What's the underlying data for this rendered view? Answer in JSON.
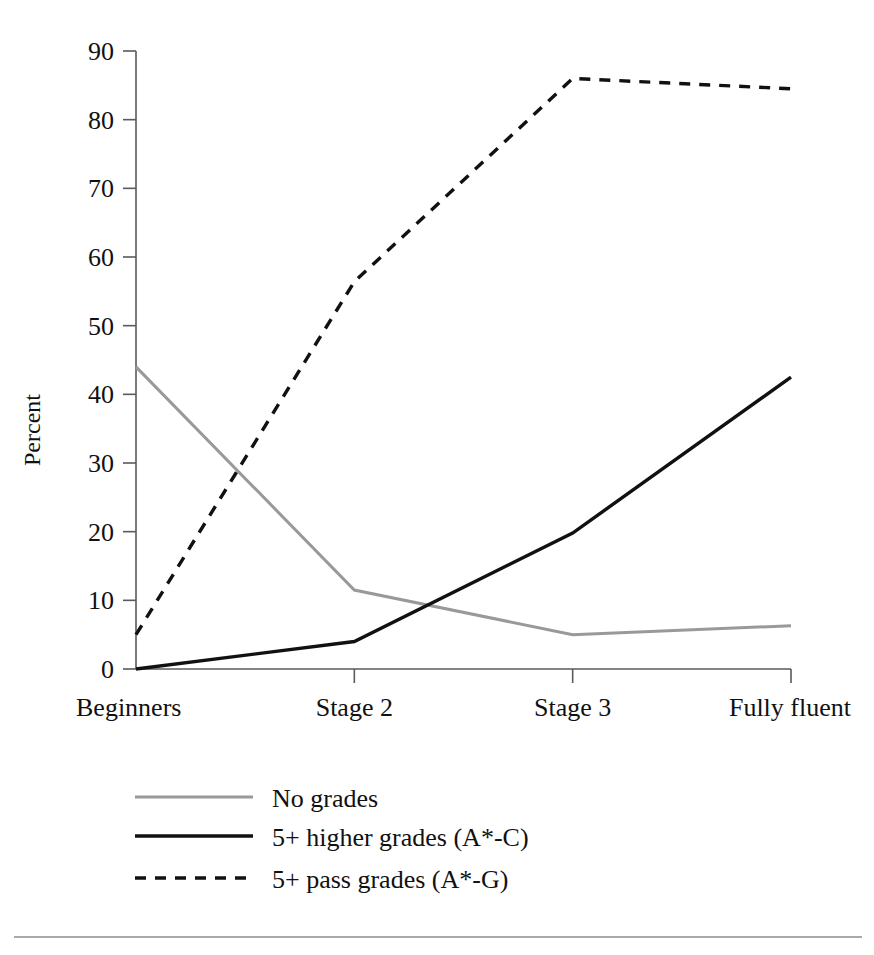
{
  "figure": {
    "background_color": "#ffffff",
    "footer_rule": true
  },
  "chart_data": {
    "type": "line",
    "title": "",
    "subtitle": "",
    "xlabel": "",
    "ylabel": "Percent",
    "categories": [
      "Beginners",
      "Stage 2",
      "Stage 3",
      "Fully fluent"
    ],
    "ylim": [
      0,
      90
    ],
    "yticks": [
      0,
      10,
      20,
      30,
      40,
      50,
      60,
      70,
      80,
      90
    ],
    "ytick_labels": [
      "0",
      "10",
      "20",
      "30",
      "40",
      "50",
      "60",
      "70",
      "80",
      "90"
    ],
    "grid": false,
    "legend_position": "below-left",
    "series": [
      {
        "name": "No grades",
        "values": [
          44,
          11.5,
          5,
          6.3
        ],
        "color": "#999999",
        "style": "solid",
        "width": 3
      },
      {
        "name": "5+ higher grades (A*-C)",
        "values": [
          0,
          4,
          19.8,
          42.5
        ],
        "color": "#111111",
        "style": "solid",
        "width": 3.4
      },
      {
        "name": "5+ pass grades (A*-G)",
        "values": [
          5,
          56.4,
          86,
          84.5
        ],
        "color": "#111111",
        "style": "dashed",
        "width": 3.4
      }
    ]
  },
  "legend": {
    "items": [
      {
        "label": "No grades",
        "color": "#999999",
        "style": "solid"
      },
      {
        "label": "5+ higher grades (A*-C)",
        "color": "#111111",
        "style": "solid"
      },
      {
        "label": "5+ pass grades (A*-G)",
        "color": "#111111",
        "style": "dashed"
      }
    ]
  }
}
